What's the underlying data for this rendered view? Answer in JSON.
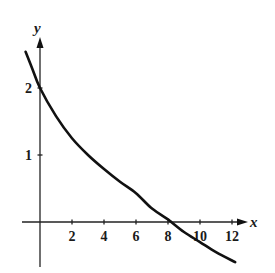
{
  "chart_data": {
    "type": "line",
    "title": "",
    "xlabel": "x",
    "ylabel": "y",
    "x_ticks": [
      2,
      4,
      6,
      8,
      10,
      12
    ],
    "y_ticks": [
      1,
      2
    ],
    "xlim": [
      -1.1,
      13.2
    ],
    "ylim": [
      -0.7,
      2.75
    ],
    "grid": false,
    "legend": null,
    "series": [
      {
        "name": "curve",
        "x": [
          -0.9,
          -0.5,
          0,
          1,
          2,
          3,
          4,
          5,
          6,
          7,
          8,
          8.2,
          9,
          10,
          11,
          12.2
        ],
        "y": [
          2.54,
          2.3,
          2.0,
          1.58,
          1.25,
          1.0,
          0.79,
          0.6,
          0.43,
          0.2,
          0.04,
          0.0,
          -0.15,
          -0.3,
          -0.45,
          -0.6
        ]
      }
    ],
    "annotations": {
      "decreasing_curve": "crosses y-axis at y=2, crosses x-axis near x=8.2"
    }
  },
  "labels": {
    "x_axis": "x",
    "y_axis": "y",
    "x_ticks": [
      "2",
      "4",
      "6",
      "8",
      "10",
      "12"
    ],
    "y_ticks": [
      "1",
      "2"
    ]
  }
}
